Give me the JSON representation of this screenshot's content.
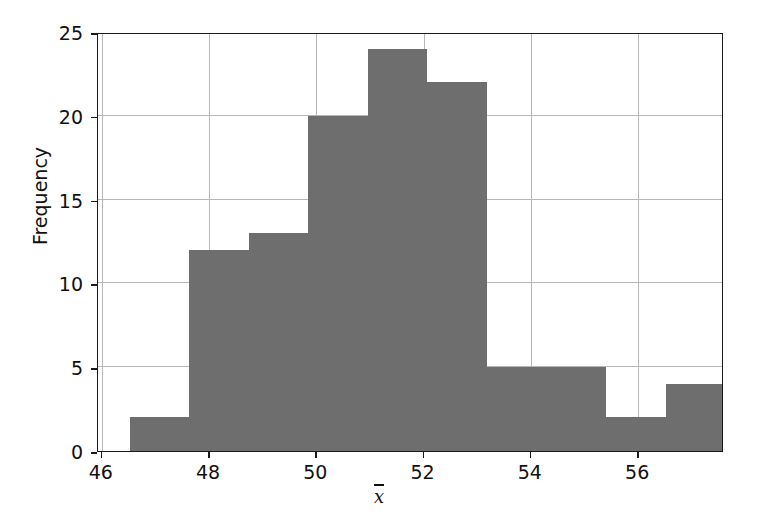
{
  "chart_data": {
    "type": "bar",
    "title": "",
    "subtitle": "",
    "xlabel": "x̄",
    "ylabel": "Frequency",
    "xlim": [
      45.93,
      57.6
    ],
    "ylim": [
      0,
      25
    ],
    "xticks": [
      46,
      48,
      50,
      52,
      54,
      56
    ],
    "yticks": [
      0,
      5,
      10,
      15,
      20,
      25
    ],
    "xtick_labels": [
      "46",
      "48",
      "50",
      "52",
      "54",
      "56"
    ],
    "ytick_labels": [
      "0",
      "5",
      "10",
      "15",
      "20",
      "25"
    ],
    "grid": true,
    "legend": false,
    "bar_color": "#6e6e6e",
    "grid_color": "#b7b7b7",
    "axis_color": "#1a1a1a",
    "background": "#ffffff",
    "bin_edges": [
      46.52,
      47.63,
      48.74,
      49.85,
      50.96,
      52.07,
      53.18,
      54.29,
      55.4,
      56.51,
      57.62
    ],
    "categories": [
      "46.52-47.63",
      "47.63-48.74",
      "48.74-49.85",
      "49.85-50.96",
      "50.96-52.07",
      "52.07-53.18",
      "53.18-54.29",
      "54.29-55.40",
      "55.40-56.51",
      "56.51-57.62"
    ],
    "values": [
      2,
      12,
      13,
      20,
      24,
      22,
      5,
      5,
      2,
      4
    ]
  },
  "axis": {
    "ylabel": "Frequency",
    "xlabel_glyph": "x"
  }
}
